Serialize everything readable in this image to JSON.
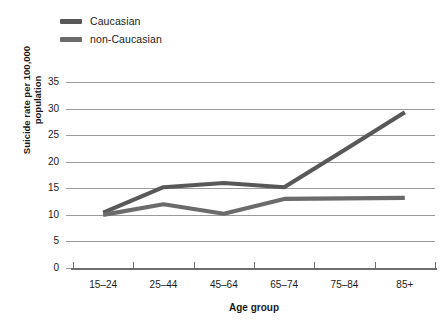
{
  "chart_data": {
    "type": "line",
    "title": "",
    "xlabel": "Age group",
    "ylabel": "Suicide rate per 100,000\npopulation",
    "categories": [
      "15–24",
      "25–44",
      "45–64",
      "65–74",
      "75–84",
      "85+"
    ],
    "series": [
      {
        "name": "Caucasian",
        "color": "#585858",
        "values": [
          10.4,
          15.2,
          16.0,
          15.2,
          22.2,
          29.3
        ]
      },
      {
        "name": "non-Caucasian",
        "color": "#6b6b6b",
        "values": [
          10.0,
          12.0,
          10.2,
          13.0,
          13.1,
          13.2
        ]
      }
    ],
    "ylim": [
      0,
      35
    ],
    "ytick_labels": [
      "0",
      "5",
      "10",
      "15",
      "20",
      "25",
      "30",
      "35"
    ],
    "ytick_values": [
      0,
      5,
      10,
      15,
      20,
      25,
      30,
      35
    ],
    "grid": true,
    "grid_color": "#9a9a9a",
    "legend_position": "top-left",
    "background": "#ffffff"
  },
  "legend": {
    "items": [
      {
        "label": "Caucasian",
        "color": "#585858"
      },
      {
        "label": "non-Caucasian",
        "color": "#6b6b6b"
      }
    ]
  },
  "axes": {
    "y_title": "Suicide rate per 100,000\npopulation",
    "x_title": "Age group"
  }
}
